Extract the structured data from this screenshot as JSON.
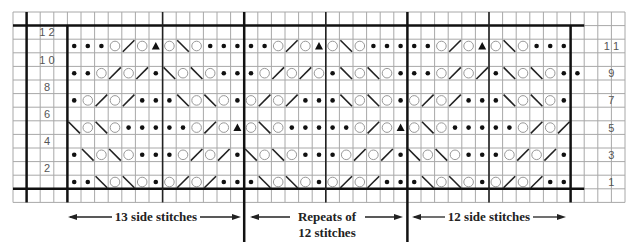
{
  "chart": {
    "grid": {
      "left": 13,
      "top": 12,
      "cell_w": 13.6,
      "cell_h": 13.6,
      "cols": 45,
      "rows": 14
    },
    "pattern_start_col": 4,
    "legend_symbols": {
      "K": "knit-dot",
      "O": "yarn-over-circle",
      "R": "right-slant-decrease",
      "L": "left-slant-decrease",
      "A": "double-decrease-triangle"
    },
    "rows": [
      {
        "number": "11",
        "side": "right",
        "cells": "KKKORO AOLOKKK KKORO AOLOKKK KKORO AOLOKKK"
      },
      {
        "number": "9",
        "side": "right",
        "cells": "KKORORKLOLOKK KOROROKLOLOKK KORORKLOLOKK"
      },
      {
        "number": "7",
        "side": "right",
        "cells": "KORORKKKLOLOK ORORKKKLOLOK ORORKKKLOLOK"
      },
      {
        "number": "5",
        "side": "right",
        "cells": "LOLOKKKKKOROA OLOKKKKKOROA OLOKKKKKOROR"
      },
      {
        "number": "3",
        "side": "right",
        "cells": "KLOLOKKKORORK LOLOKKKORORK LOLOKKKORORK"
      },
      {
        "number": "1",
        "side": "right",
        "cells": "KKLOLOKORORKK KLOLOKORORKK KLOLOKORORKK"
      }
    ],
    "left_labels": [
      {
        "text": "1 2",
        "row": 1
      },
      {
        "text": "1 0",
        "row": 3
      },
      {
        "text": "8",
        "row": 5
      },
      {
        "text": "6",
        "row": 7
      },
      {
        "text": "4",
        "row": 9
      },
      {
        "text": "2",
        "row": 11
      }
    ],
    "right_labels": [
      {
        "text": "1 1",
        "row": 2
      },
      {
        "text": "9",
        "row": 4
      },
      {
        "text": "7",
        "row": 6
      },
      {
        "text": "5",
        "row": 8
      },
      {
        "text": "3",
        "row": 10
      },
      {
        "text": "1",
        "row": 12
      }
    ],
    "annotations": {
      "left": "13 side stitches",
      "middle_line1": "Repeats of",
      "middle_line2": "12 stitches",
      "right": "12 side stitches"
    }
  }
}
